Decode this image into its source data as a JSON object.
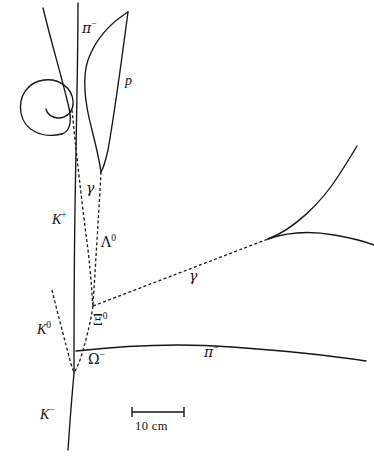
{
  "figure": {
    "kind": "bubble-chamber-event-diagram",
    "width": 374,
    "height": 457,
    "background_color": "#ffffff",
    "line_color": "#161616"
  },
  "labels": {
    "pi_minus_top": {
      "text": "π−",
      "base": "π",
      "sup": "−",
      "x": 82,
      "y": 21
    },
    "proton": {
      "text": "p",
      "base": "p",
      "sup": "",
      "x": 125,
      "y": 74
    },
    "gamma_left": {
      "text": "γ",
      "base": "γ",
      "sup": "",
      "x": 86,
      "y": 181
    },
    "k_plus": {
      "text": "K+",
      "base": "K",
      "sup": "+",
      "x": 52,
      "y": 213
    },
    "lambda_zero": {
      "text": "Λ0",
      "base": "Λ",
      "sup": "0",
      "x": 101,
      "y": 235
    },
    "gamma_right": {
      "text": "γ",
      "base": "γ",
      "sup": "",
      "x": 189,
      "y": 269
    },
    "xi_zero": {
      "text": "Ξ0",
      "base": "Ξ",
      "sup": "0",
      "x": 93,
      "y": 313
    },
    "k_zero": {
      "text": "K0",
      "base": "K",
      "sup": "0",
      "x": 37,
      "y": 323
    },
    "omega_minus": {
      "text": "Ω−",
      "base": "Ω",
      "sup": "−",
      "x": 88,
      "y": 352
    },
    "pi_minus_bottom": {
      "text": "π−",
      "base": "π",
      "sup": "−",
      "x": 204,
      "y": 345
    },
    "k_minus": {
      "text": "K−",
      "base": "K",
      "sup": "−",
      "x": 40,
      "y": 408
    }
  },
  "scale_bar": {
    "caption": "10 cm",
    "x_start": 132,
    "x_end": 184,
    "y": 412,
    "tick_half_height": 5,
    "caption_x": 135,
    "caption_y": 419
  },
  "tracks": {
    "spiral_incoming": {
      "name": "spiraling-track",
      "style": "solid",
      "d": "M 43 8 C 52 45, 62 78, 69 108 C 72 122, 70 131, 62 134"
    },
    "spiral_loop": {
      "name": "spiral-loop",
      "style": "solid",
      "d": "M 62 134 C 42 139, 24 130, 21 113 C 18 96, 28 82, 44 80 C 59 78, 72 88, 73 101 C 74 111, 67 118, 58 118 C 52 118, 47 114, 46 109"
    },
    "k_plus_track": {
      "name": "k-plus-track",
      "style": "solid",
      "d": "M 78 3 C 78 60, 76 140, 75 210 C 74 270, 74 330, 74 373"
    },
    "k_minus_track": {
      "name": "k-minus-track",
      "style": "solid",
      "d": "M 74 373 C 72 395, 70 420, 68 450"
    },
    "pi_minus_upper": {
      "name": "pi-minus-upper-track",
      "style": "solid",
      "d": "M 128 12 C 112 22, 96 38, 88 60 C 82 78, 84 100, 92 130 C 97 150, 100 165, 101 172"
    },
    "proton_track": {
      "name": "proton-track",
      "style": "solid",
      "d": "M 128 12 C 123 50, 115 110, 108 150 C 105 163, 103 169, 101 172"
    },
    "lambda_dashed": {
      "name": "lambda-decay-dashed",
      "style": "dashed",
      "d": "M 101 172 C 99 210, 96 255, 94 290 C 93 299, 93 303, 93 306"
    },
    "gamma_left_dashed": {
      "name": "gamma-left-dashed",
      "style": "dashed",
      "d": "M 72 110 C 76 150, 82 205, 88 250 C 91 275, 92 296, 93 306"
    },
    "xi_zero_dashed": {
      "name": "xi-zero-dashed",
      "style": "dashed",
      "d": "M 93 306 C 90 325, 85 345, 80 360 C 77 368, 75 371, 74 373"
    },
    "gamma_right_dashed": {
      "name": "gamma-right-dashed",
      "style": "dashed",
      "d": "M 93 306 L 268 239"
    },
    "pair_electron_up": {
      "name": "pair-electron-upper-track",
      "style": "solid",
      "d": "M 268 239 C 292 230, 320 205, 339 175 C 348 161, 354 151, 357 146"
    },
    "pair_electron_arc": {
      "name": "pair-electron-lower-track",
      "style": "solid",
      "d": "M 268 239 C 288 232, 312 231, 334 235 C 352 238, 366 242, 374 245"
    },
    "k_zero_dashed": {
      "name": "k-zero-dashed",
      "style": "dashed",
      "d": "M 52 290 C 58 315, 66 345, 71 364 C 73 370, 74 372, 74 373"
    },
    "pi_minus_lower": {
      "name": "pi-minus-lower-track",
      "style": "solid",
      "d": "M 76 351 C 120 346, 180 343, 232 347 C 290 351, 340 357, 366 361"
    }
  }
}
